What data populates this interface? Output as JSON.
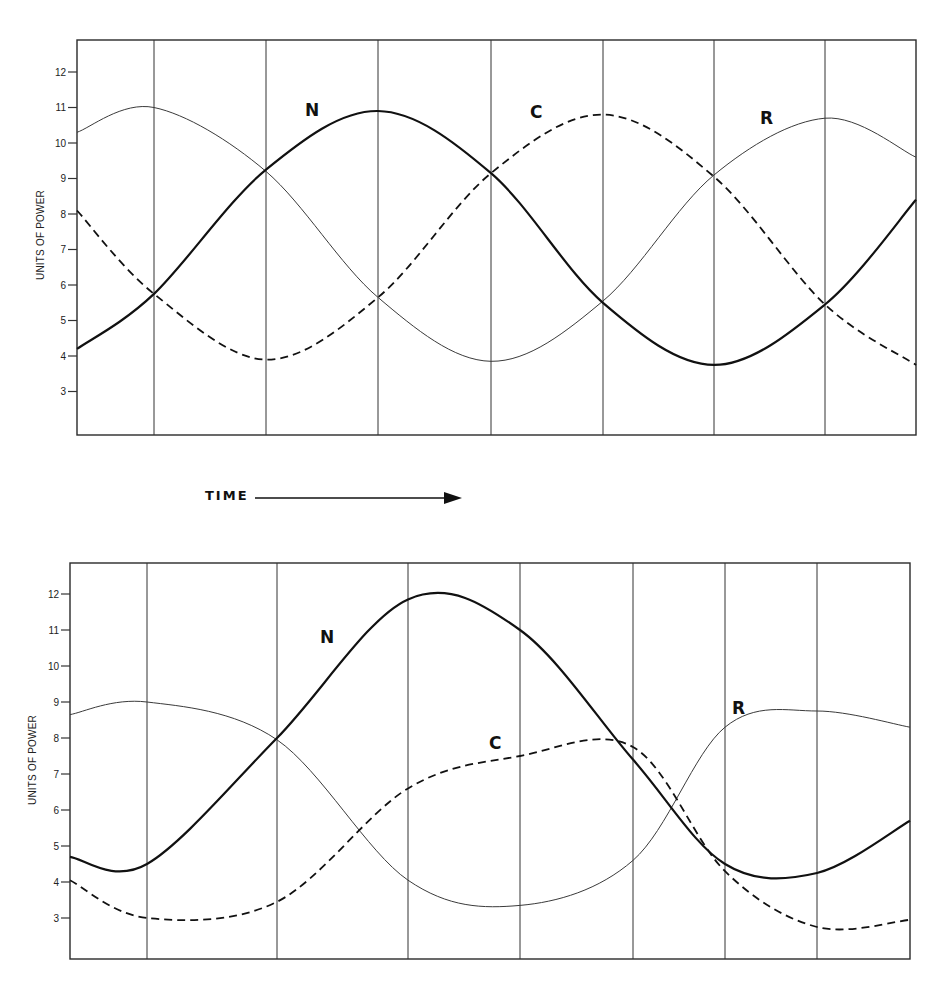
{
  "figure": {
    "time_label": "TIME",
    "y_axis_label": "UNITS OF POWER"
  },
  "chart_data": [
    {
      "type": "line",
      "title": "",
      "xlabel": "TIME",
      "ylabel": "UNITS OF POWER",
      "ylim": [
        2,
        13
      ],
      "yticks": [
        3,
        4,
        5,
        6,
        7,
        8,
        9,
        10,
        11,
        12
      ],
      "grid": "vertical lines only (7 interior)",
      "legend": "inline labels N, C, R",
      "x": [
        0,
        1,
        2,
        3,
        4,
        5,
        6,
        7,
        7.8
      ],
      "series": [
        {
          "name": "R",
          "style": "thin solid",
          "values": [
            10.3,
            11.0,
            9.2,
            5.65,
            3.85,
            5.55,
            9.1,
            10.7,
            9.6
          ]
        },
        {
          "name": "N",
          "style": "thick solid",
          "values": [
            4.2,
            5.75,
            9.25,
            10.9,
            9.15,
            5.5,
            3.75,
            5.45,
            8.4
          ]
        },
        {
          "name": "C",
          "style": "dashed",
          "values": [
            8.1,
            5.75,
            3.9,
            5.65,
            9.15,
            10.8,
            9.05,
            5.45,
            3.75
          ]
        }
      ],
      "annotations": [
        {
          "text": "N",
          "near": "peak of N (~x=2.5)"
        },
        {
          "text": "C",
          "near": "rise of C (~x=4.4)"
        },
        {
          "text": "R",
          "near": "peak of R (~x=6.6)"
        }
      ]
    },
    {
      "type": "line",
      "title": "",
      "xlabel": "TIME",
      "ylabel": "UNITS OF POWER",
      "ylim": [
        2,
        13
      ],
      "yticks": [
        3,
        4,
        5,
        6,
        7,
        8,
        9,
        10,
        11,
        12
      ],
      "grid": "vertical lines only (7 interior)",
      "legend": "inline labels N, C, R",
      "x": [
        0,
        1,
        2,
        3,
        4,
        5,
        6,
        7,
        8
      ],
      "series": [
        {
          "name": "R",
          "style": "thin solid",
          "values": [
            8.65,
            9.0,
            7.95,
            4.05,
            3.35,
            4.6,
            8.3,
            8.75,
            8.3
          ]
        },
        {
          "name": "N",
          "style": "thick solid",
          "values": [
            4.7,
            4.5,
            8.0,
            11.85,
            11.0,
            7.4,
            4.5,
            4.25,
            5.7
          ]
        },
        {
          "name": "C",
          "style": "dashed",
          "values": [
            4.05,
            3.0,
            3.45,
            6.6,
            7.5,
            7.75,
            4.3,
            2.75,
            2.95
          ]
        }
      ],
      "annotations": [
        {
          "text": "N",
          "near": "rise of N (~x=2.5)"
        },
        {
          "text": "C",
          "near": "C plateau (~x=4.0)"
        },
        {
          "text": "R",
          "near": "rise of R (~x=5.8)"
        }
      ]
    }
  ],
  "layout": {
    "charts": [
      {
        "left": 77,
        "right": 916,
        "top": 40,
        "bottom": 435,
        "y12": 72,
        "unit_px": 35.5,
        "xpix": [
          77,
          154,
          266,
          378,
          491,
          603,
          714,
          825,
          916
        ],
        "vlines": [
          154,
          266,
          378,
          491,
          603,
          714,
          825
        ],
        "ylabel_x": 44,
        "ylabel_y": 235,
        "labels": {
          "N": [
            305,
            116
          ],
          "C": [
            530,
            118
          ],
          "R": [
            760,
            124
          ]
        }
      },
      {
        "left": 70,
        "right": 910,
        "top": 563,
        "bottom": 959,
        "y12": 594,
        "unit_px": 36,
        "xpix": [
          70,
          147,
          277,
          408,
          520,
          633,
          725,
          817,
          910
        ],
        "vlines": [
          147,
          277,
          408,
          520,
          633,
          725,
          817
        ],
        "ylabel_x": 36,
        "ylabel_y": 760,
        "labels": {
          "N": [
            320,
            643
          ],
          "C": [
            489,
            749
          ],
          "R": [
            732,
            714
          ]
        }
      }
    ],
    "arrow": {
      "text_x": 205,
      "text_y": 500,
      "x1": 255,
      "x2": 462,
      "y": 498
    }
  }
}
